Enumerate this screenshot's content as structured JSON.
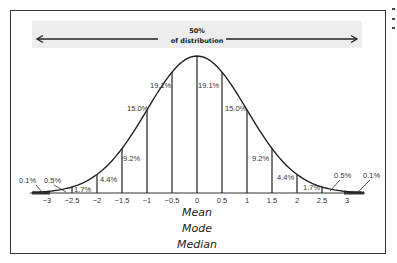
{
  "chart_data": {
    "type": "area",
    "annotation": {
      "line1": "50%",
      "line2": "of distribution"
    },
    "x_ticks": [
      "-3",
      "-2.5",
      "-2",
      "-1.5",
      "-1",
      "-0.5",
      "0",
      "0.5",
      "1",
      "1.5",
      "2",
      "2.5",
      "3"
    ],
    "segments": [
      {
        "range": "<-3",
        "percent": "0.1%"
      },
      {
        "range": "-3 to -2.5",
        "percent": "0.5%"
      },
      {
        "range": "-2.5 to -2",
        "percent": "1.7%"
      },
      {
        "range": "-2 to -1.5",
        "percent": "4.4%"
      },
      {
        "range": "-1.5 to -1",
        "percent": "9.2%"
      },
      {
        "range": "-1 to -0.5",
        "percent": "15.0%"
      },
      {
        "range": "-0.5 to 0",
        "percent": "19.1%"
      },
      {
        "range": "0 to 0.5",
        "percent": "19.1%"
      },
      {
        "range": "0.5 to 1",
        "percent": "15.0%"
      },
      {
        "range": "1 to 1.5",
        "percent": "9.2%"
      },
      {
        "range": "1.5 to 2",
        "percent": "4.4%"
      },
      {
        "range": "2 to 2.5",
        "percent": "1.7%"
      },
      {
        "range": "2.5 to 3",
        "percent": "0.5%"
      },
      {
        "range": ">3",
        "percent": "0.1%"
      }
    ],
    "center_labels": [
      "Mean",
      "Mode",
      "Median"
    ],
    "xlabel": "",
    "ylabel": "",
    "xlim": [
      -3,
      3
    ],
    "grid": false,
    "legend": "none"
  }
}
